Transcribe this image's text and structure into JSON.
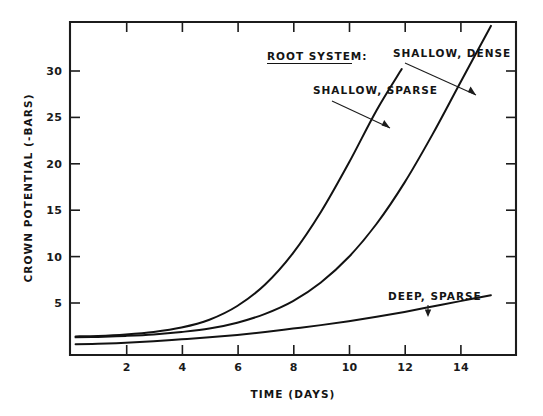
{
  "chart_data": {
    "type": "line",
    "title": "",
    "xlabel": "TIME (DAYS)",
    "ylabel": "CROWN POTENTIAL (-BARS)",
    "xlim": [
      0,
      16
    ],
    "ylim": [
      0,
      34
    ],
    "xticks": [
      "2",
      "4",
      "6",
      "8",
      "10",
      "12",
      "14"
    ],
    "xtick_values": [
      2,
      4,
      6,
      8,
      10,
      12,
      14
    ],
    "yticks": [
      "5",
      "10",
      "15",
      "20",
      "25",
      "30"
    ],
    "ytick_values": [
      5,
      10,
      15,
      20,
      25,
      30
    ],
    "grid": false,
    "legend_position": "inline-annotations",
    "legend_heading": "ROOT SYSTEM:",
    "series": [
      {
        "name": "SHALLOW, SPARSE",
        "x": [
          0.2,
          1,
          2,
          3,
          4,
          5,
          6,
          7,
          8,
          9,
          10,
          11,
          11.9
        ],
        "values": [
          1.9,
          1.95,
          2.1,
          2.35,
          2.8,
          3.6,
          5.0,
          7.2,
          10.4,
          14.6,
          19.6,
          25.0,
          29.2
        ]
      },
      {
        "name": "SHALLOW, DENSE",
        "x": [
          0.2,
          1,
          2,
          3,
          4,
          5,
          6,
          7,
          8,
          9,
          10,
          11,
          12,
          13,
          14,
          15.1
        ],
        "values": [
          1.8,
          1.85,
          1.95,
          2.1,
          2.35,
          2.7,
          3.3,
          4.2,
          5.5,
          7.4,
          10.0,
          13.4,
          17.6,
          22.5,
          27.8,
          33.6
        ]
      },
      {
        "name": "DEEP, SPARSE",
        "x": [
          0.2,
          1,
          2,
          3,
          4,
          5,
          6,
          7,
          8,
          9,
          10,
          11,
          12,
          13,
          14,
          15.1
        ],
        "values": [
          1.1,
          1.15,
          1.25,
          1.4,
          1.6,
          1.8,
          2.05,
          2.35,
          2.7,
          3.05,
          3.45,
          3.9,
          4.4,
          4.95,
          5.5,
          6.1
        ]
      }
    ],
    "annotations": [
      {
        "label": "ROOT SYSTEM:",
        "underlined": true
      },
      {
        "label": "SHALLOW, DENSE",
        "points_to_series": "SHALLOW, DENSE"
      },
      {
        "label": "SHALLOW, SPARSE",
        "points_to_series": "SHALLOW, SPARSE"
      },
      {
        "label": "DEEP, SPARSE",
        "points_to_series": "DEEP, SPARSE"
      }
    ],
    "colors": {
      "line": "#121212",
      "axis": "#1c1c1c",
      "text": "#141414",
      "background": "#ffffff"
    }
  }
}
